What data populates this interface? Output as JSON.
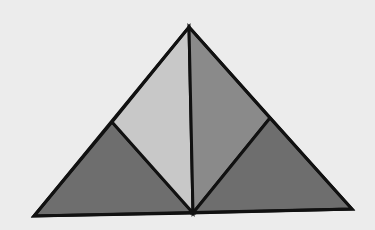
{
  "diagram": {
    "type": "dissected-triangle",
    "background_color": "#ececec",
    "stroke_color": "#111111",
    "stroke_width": 3,
    "vertices": {
      "apex": [
        189,
        27
      ],
      "bottom_left": [
        34,
        216
      ],
      "bottom_mid": [
        193,
        213
      ],
      "bottom_right": [
        352,
        209
      ],
      "left_mid": [
        112,
        122
      ],
      "right_mid": [
        270,
        118
      ]
    },
    "pieces": [
      {
        "name": "left-bottom-triangle",
        "fill": "#6e6e6e",
        "points": "34,216 112,122 193,213"
      },
      {
        "name": "left-upper-quad",
        "fill": "#c8c8c8",
        "points": "112,122 189,27 193,213"
      },
      {
        "name": "right-upper-quad",
        "fill": "#8a8a8a",
        "points": "189,27 270,118 193,213"
      },
      {
        "name": "right-bottom-triangle",
        "fill": "#6e6e6e",
        "points": "270,118 352,209 193,213"
      }
    ]
  }
}
